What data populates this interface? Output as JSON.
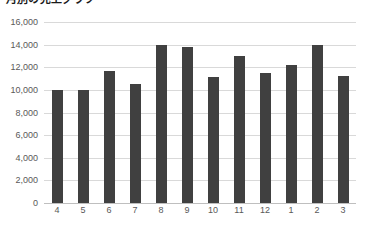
{
  "chart_data": {
    "type": "bar",
    "title": "月別の売上グラフ",
    "xlabel": "",
    "ylabel": "",
    "categories": [
      "4",
      "5",
      "6",
      "7",
      "8",
      "9",
      "10",
      "11",
      "12",
      "1",
      "2",
      "3"
    ],
    "values": [
      10000,
      10000,
      11700,
      10500,
      14000,
      13800,
      11100,
      13000,
      11500,
      12200,
      14000,
      11200
    ],
    "ylim": [
      0,
      16000
    ],
    "ytick_step": 2000,
    "ytick_labels": [
      "0",
      "2,000",
      "4,000",
      "6,000",
      "8,000",
      "10,000",
      "12,000",
      "14,000",
      "16,000"
    ],
    "grid": true,
    "legend": false,
    "legend_position": "none",
    "series": [
      {
        "name": "売上",
        "values": [
          10000,
          10000,
          11700,
          10500,
          14000,
          13800,
          11100,
          13000,
          11500,
          12200,
          14000,
          11200
        ]
      }
    ],
    "colors": {
      "bar": "#404040",
      "gridline": "#d9d9d9",
      "axis": "#bfbfbf",
      "tick_text": "#595959",
      "title_text": "#1a1a1a",
      "background": "#ffffff"
    }
  }
}
